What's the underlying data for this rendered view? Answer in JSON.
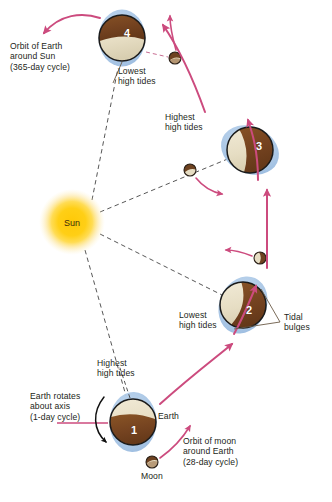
{
  "diagram": {
    "colors": {
      "sun_core": "#ffd21e",
      "sun_glow": "#fde9a8",
      "earth_land": "#7b4a22",
      "earth_ocean": "#e8e0c8",
      "tidal_bulge": "#a9c6e6",
      "orbit_arrow": "#d44a80",
      "rotation_arrow": "#000000",
      "dashed_line": "#3a3a3a",
      "leader_line": "#5b4a3a",
      "text": "#231f20"
    },
    "sun": {
      "label": "Sun",
      "cx": 72,
      "cy": 222,
      "r": 30
    },
    "earths": [
      {
        "id": "earth-1",
        "number": "1",
        "cx": 133,
        "cy": 422,
        "r": 23,
        "bulge_angle_deg": 92,
        "terminator_deg": 8,
        "land_on": "bottom"
      },
      {
        "id": "earth-2",
        "number": "2",
        "cx": 243,
        "cy": 305,
        "r": 23,
        "bulge_angle_deg": 110,
        "terminator_deg": 62,
        "land_on": "right"
      },
      {
        "id": "earth-3",
        "number": "3",
        "cx": 250,
        "cy": 150,
        "r": 23,
        "bulge_angle_deg": 58,
        "terminator_deg": 75,
        "land_on": "right"
      },
      {
        "id": "earth-4",
        "number": "4",
        "cx": 122,
        "cy": 38,
        "r": 23,
        "bulge_angle_deg": 0,
        "terminator_deg": 0,
        "land_on": "top"
      }
    ],
    "moons": [
      {
        "id": "moon-1",
        "cx": 152,
        "cy": 462,
        "r": 6
      },
      {
        "id": "moon-2",
        "cx": 260,
        "cy": 258,
        "r": 6
      },
      {
        "id": "moon-3",
        "cx": 190,
        "cy": 170,
        "r": 6
      },
      {
        "id": "moon-4",
        "cx": 175,
        "cy": 58,
        "r": 6
      }
    ],
    "labels": {
      "orbit_of_earth": "Orbit of Earth\naround Sun\n(365-day cycle)",
      "lowest_high_tides_top": "Lowest\nhigh tides",
      "highest_high_tides_mid": "Highest\nhigh tides",
      "lowest_high_tides_mid": "Lowest\nhigh tides",
      "tidal_bulges": "Tidal\nbulges",
      "highest_high_tides_bottom": "Highest\nhigh tides",
      "earth_rotates": "Earth rotates\nabout axis\n(1-day cycle)",
      "earth": "Earth",
      "moon": "Moon",
      "orbit_of_moon": "Orbit of moon\naround Earth\n(28-day cycle)"
    }
  }
}
